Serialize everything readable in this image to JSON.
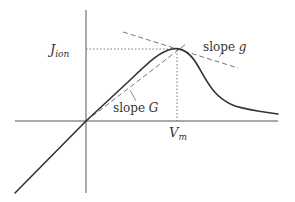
{
  "diagram": {
    "type": "current-voltage characteristic",
    "axes": {
      "vertical": {
        "x": 86,
        "y_top": 10,
        "y_bottom": 193
      },
      "horizontal": {
        "y": 121,
        "x_left": 15,
        "x_right": 278
      }
    },
    "peak": {
      "x": 177,
      "y": 49
    },
    "labels": {
      "j_ion_main": "J",
      "j_ion_sub": "ion",
      "v_m_main": "V",
      "v_m_sub": "m",
      "slope_G_word": "slope ",
      "slope_G_var": "G",
      "slope_g_word": "slope ",
      "slope_g_var": "g"
    },
    "colors": {
      "curve": "#333333",
      "axes": "#555555",
      "dashed": "#777777",
      "dotted": "#777777",
      "text": "#333333"
    }
  }
}
